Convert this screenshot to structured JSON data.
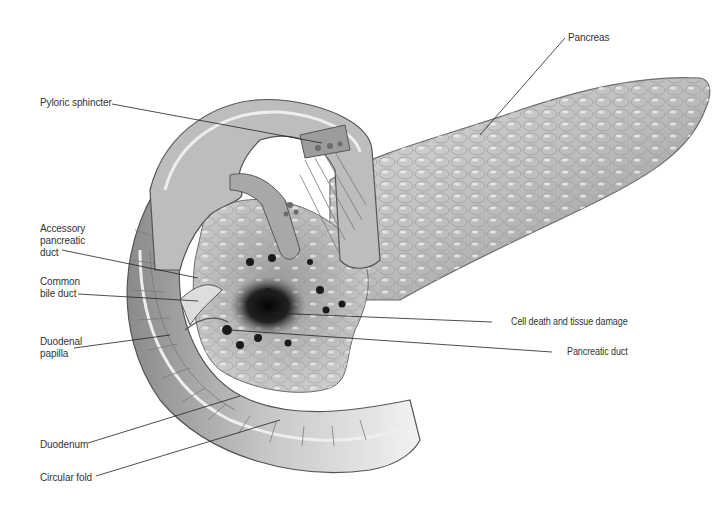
{
  "figure": {
    "palette": {
      "background": "#ffffff",
      "tissue_light": "#e4e4e4",
      "tissue_mid": "#a8a8a8",
      "tissue_dark": "#5a5a5a",
      "necrosis": "#111111",
      "label_text": "#333333",
      "leader_line": "#222222"
    }
  },
  "labels": {
    "pancreas": "Pancreas",
    "pyloric_sphincter": "Pyloric sphincter",
    "accessory_pancreatic_duct": "Accessory\npancreatic\nduct",
    "common_bile_duct": "Common\nbile duct",
    "duodenal_papilla": "Duodenal\npapilla",
    "duodenum": "Duodenum",
    "circular_fold": "Circular fold",
    "cell_death": "Cell death and tissue damage",
    "pancreatic_duct": "Pancreatic duct"
  }
}
